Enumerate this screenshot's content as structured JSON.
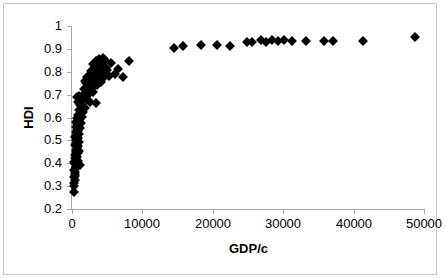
{
  "chart_data": {
    "type": "scatter",
    "title": "",
    "xlabel": "GDP/c",
    "ylabel": "HDI",
    "xlim": [
      0,
      50000
    ],
    "ylim": [
      0.2,
      1
    ],
    "xticks": [
      0,
      10000,
      20000,
      30000,
      40000,
      50000
    ],
    "xtick_labels": [
      "0",
      "10000",
      "20000",
      "30000",
      "40000",
      "50000"
    ],
    "yticks": [
      0.2,
      0.3,
      0.4,
      0.5,
      0.6,
      0.7,
      0.8,
      0.9,
      1
    ],
    "ytick_labels": [
      "0.2",
      "0.3",
      "0.4",
      "0.5",
      "0.6",
      "0.7",
      "0.8",
      "0.9",
      "1"
    ],
    "grid": false,
    "legend": null,
    "marker": "diamond",
    "marker_color": "#000000",
    "series": [
      {
        "name": "Countries",
        "points": [
          [
            280,
            0.273
          ],
          [
            350,
            0.302
          ],
          [
            330,
            0.315
          ],
          [
            360,
            0.327
          ],
          [
            300,
            0.338
          ],
          [
            420,
            0.345
          ],
          [
            390,
            0.355
          ],
          [
            480,
            0.36
          ],
          [
            350,
            0.372
          ],
          [
            520,
            0.378
          ],
          [
            600,
            0.383
          ],
          [
            1150,
            0.392
          ],
          [
            430,
            0.396
          ],
          [
            700,
            0.4
          ],
          [
            330,
            0.404
          ],
          [
            900,
            0.408
          ],
          [
            560,
            0.415
          ],
          [
            480,
            0.422
          ],
          [
            740,
            0.428
          ],
          [
            620,
            0.433
          ],
          [
            400,
            0.438
          ],
          [
            820,
            0.443
          ],
          [
            560,
            0.448
          ],
          [
            960,
            0.455
          ],
          [
            500,
            0.46
          ],
          [
            700,
            0.465
          ],
          [
            640,
            0.47
          ],
          [
            880,
            0.475
          ],
          [
            430,
            0.48
          ],
          [
            760,
            0.485
          ],
          [
            590,
            0.49
          ],
          [
            1030,
            0.495
          ],
          [
            520,
            0.5
          ],
          [
            680,
            0.505
          ],
          [
            860,
            0.51
          ],
          [
            450,
            0.515
          ],
          [
            740,
            0.52
          ],
          [
            610,
            0.525
          ],
          [
            950,
            0.53
          ],
          [
            530,
            0.535
          ],
          [
            800,
            0.54
          ],
          [
            660,
            0.546
          ],
          [
            1100,
            0.552
          ],
          [
            580,
            0.558
          ],
          [
            870,
            0.563
          ],
          [
            700,
            0.57
          ],
          [
            1250,
            0.576
          ],
          [
            620,
            0.582
          ],
          [
            940,
            0.59
          ],
          [
            760,
            0.597
          ],
          [
            1400,
            0.603
          ],
          [
            840,
            0.612
          ],
          [
            1600,
            0.622
          ],
          [
            1050,
            0.632
          ],
          [
            1850,
            0.643
          ],
          [
            1200,
            0.655
          ],
          [
            900,
            0.666
          ],
          [
            1450,
            0.672
          ],
          [
            2100,
            0.676
          ],
          [
            1700,
            0.68
          ],
          [
            1150,
            0.684
          ],
          [
            760,
            0.688
          ],
          [
            990,
            0.692
          ],
          [
            2600,
            0.668
          ],
          [
            3400,
            0.662
          ],
          [
            2250,
            0.7
          ],
          [
            1900,
            0.706
          ],
          [
            3050,
            0.712
          ],
          [
            2450,
            0.718
          ],
          [
            1700,
            0.724
          ],
          [
            2900,
            0.73
          ],
          [
            2200,
            0.735
          ],
          [
            3600,
            0.74
          ],
          [
            2700,
            0.745
          ],
          [
            2050,
            0.75
          ],
          [
            3200,
            0.752
          ],
          [
            2500,
            0.756
          ],
          [
            1900,
            0.76
          ],
          [
            4100,
            0.757
          ],
          [
            2350,
            0.764
          ],
          [
            3750,
            0.768
          ],
          [
            2850,
            0.772
          ],
          [
            2150,
            0.776
          ],
          [
            4600,
            0.775
          ],
          [
            3300,
            0.78
          ],
          [
            2600,
            0.784
          ],
          [
            5300,
            0.783
          ],
          [
            3900,
            0.788
          ],
          [
            3000,
            0.792
          ],
          [
            6100,
            0.79
          ],
          [
            4400,
            0.796
          ],
          [
            3450,
            0.8
          ],
          [
            2750,
            0.804
          ],
          [
            5000,
            0.806
          ],
          [
            3700,
            0.812
          ],
          [
            4900,
            0.816
          ],
          [
            3200,
            0.82
          ],
          [
            4300,
            0.824
          ],
          [
            3600,
            0.83
          ],
          [
            2950,
            0.834
          ],
          [
            5500,
            0.838
          ],
          [
            4050,
            0.842
          ],
          [
            3400,
            0.846
          ],
          [
            4700,
            0.85
          ],
          [
            3800,
            0.856
          ],
          [
            4450,
            0.862
          ],
          [
            8100,
            0.845
          ],
          [
            7200,
            0.775
          ],
          [
            6500,
            0.81
          ],
          [
            14500,
            0.905
          ],
          [
            15800,
            0.912
          ],
          [
            18300,
            0.915
          ],
          [
            20600,
            0.918
          ],
          [
            22400,
            0.912
          ],
          [
            24900,
            0.928
          ],
          [
            25600,
            0.932
          ],
          [
            26800,
            0.938
          ],
          [
            27600,
            0.93
          ],
          [
            28400,
            0.938
          ],
          [
            29300,
            0.936
          ],
          [
            30100,
            0.938
          ],
          [
            31200,
            0.936
          ],
          [
            33200,
            0.935
          ],
          [
            35800,
            0.933
          ],
          [
            37100,
            0.934
          ],
          [
            41300,
            0.935
          ],
          [
            48700,
            0.95
          ]
        ]
      }
    ]
  },
  "axes": {
    "y_title": "HDI",
    "x_title": "GDP/c"
  }
}
